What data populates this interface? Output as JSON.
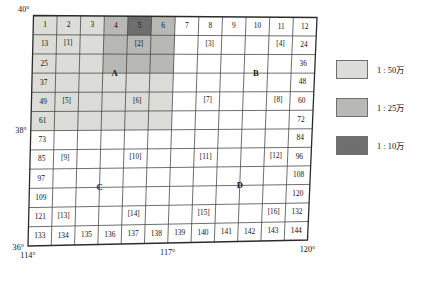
{
  "figure": {
    "type": "map-sheet-index-grid",
    "grid": {
      "columns": 12,
      "rows": 12,
      "column_headers": [
        "1",
        "2",
        "3",
        "4",
        "5",
        "6",
        "7",
        "8",
        "9",
        "10",
        "11",
        "12"
      ],
      "bottom_row_labels": [
        "133",
        "134",
        "135",
        "136",
        "137",
        "138",
        "139",
        "140",
        "141",
        "142",
        "143",
        "144"
      ],
      "left_edge_labels": [
        "1",
        "13",
        "25",
        "37",
        "49",
        "61",
        "73",
        "85",
        "97",
        "109",
        "121",
        "133"
      ],
      "right_edge_labels": [
        "12",
        "24",
        "36",
        "48",
        "60",
        "72",
        "84",
        "96",
        "108",
        "120",
        "132",
        "144"
      ]
    },
    "bracket_labels": [
      {
        "text": "[1]",
        "row": 2,
        "col": 2
      },
      {
        "text": "[2]",
        "row": 2,
        "col": 5
      },
      {
        "text": "[3]",
        "row": 2,
        "col": 8
      },
      {
        "text": "[4]",
        "row": 2,
        "col": 11
      },
      {
        "text": "[5]",
        "row": 5,
        "col": 2
      },
      {
        "text": "[6]",
        "row": 5,
        "col": 5
      },
      {
        "text": "[7]",
        "row": 5,
        "col": 8
      },
      {
        "text": "[8]",
        "row": 5,
        "col": 11
      },
      {
        "text": "[9]",
        "row": 8,
        "col": 2
      },
      {
        "text": "[10]",
        "row": 8,
        "col": 5
      },
      {
        "text": "[11]",
        "row": 8,
        "col": 8
      },
      {
        "text": "[12]",
        "row": 8,
        "col": 11
      },
      {
        "text": "[13]",
        "row": 11,
        "col": 2
      },
      {
        "text": "[14]",
        "row": 11,
        "col": 5
      },
      {
        "text": "[15]",
        "row": 11,
        "col": 8
      },
      {
        "text": "[16]",
        "row": 11,
        "col": 11
      }
    ],
    "points": [
      {
        "label": "A",
        "col": 3.5,
        "row": 3.0
      },
      {
        "label": "B",
        "col": 9.5,
        "row": 3.0
      },
      {
        "label": "C",
        "col": 3.0,
        "row": 9.0
      },
      {
        "label": "D",
        "col": 9.0,
        "row": 9.0
      }
    ],
    "shaded_regions": [
      {
        "scale": "1 : 50万",
        "color": "#dcdcd8",
        "col_start": 1,
        "col_end": 6,
        "row_start": 1,
        "row_end": 6
      },
      {
        "scale": "1 : 25万",
        "color": "#b8b8b4",
        "col_start": 4,
        "col_end": 6,
        "row_start": 1,
        "row_end": 3
      },
      {
        "scale": "1 : 10万",
        "color": "#6e6e6e",
        "col_start": 5,
        "col_end": 5,
        "row_start": 1,
        "row_end": 1
      }
    ],
    "latitude_labels": [
      {
        "text": "40°",
        "row_edge": 0
      },
      {
        "text": "38°",
        "row_edge": 6
      },
      {
        "text": "36°",
        "row_edge": 12
      }
    ],
    "longitude_labels": [
      {
        "text": "114°",
        "col_edge": 0
      },
      {
        "text": "117°",
        "col_edge": 6
      },
      {
        "text": "120°",
        "col_edge": 12
      }
    ]
  },
  "legend": {
    "items": [
      {
        "scale_text": "1 : 50万",
        "color": "#dcdcd8",
        "icon": "legend-swatch-light"
      },
      {
        "scale_text": "1 : 25万",
        "color": "#b8b8b4",
        "icon": "legend-swatch-medium"
      },
      {
        "scale_text": "1 : 10万",
        "color": "#6e6e6e",
        "icon": "legend-swatch-dark"
      }
    ]
  },
  "style": {
    "grid_line_color": "#4a4a4a",
    "grid_border_color": "#2b2b2b",
    "background": "#ffffff"
  }
}
